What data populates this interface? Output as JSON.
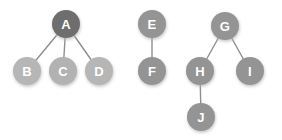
{
  "diagram": {
    "background_color": "#ffffff",
    "node_radius": 14,
    "label_font_size": 13,
    "edge_color": "#8e8e8e",
    "edge_width": 1.4,
    "shadow_color": "#c9c9c9",
    "components": [
      {
        "id": "component-1",
        "name": "star-component-a"
      },
      {
        "id": "component-2",
        "name": "pair-component-ef"
      },
      {
        "id": "component-3",
        "name": "tree-component-g"
      }
    ],
    "nodes": [
      {
        "id": "A",
        "label": "A",
        "cx": 66,
        "cy": 24,
        "color": "#6e6e6e",
        "component": "component-1"
      },
      {
        "id": "B",
        "label": "B",
        "cx": 27,
        "cy": 71,
        "color": "#b6b6b6",
        "component": "component-1"
      },
      {
        "id": "C",
        "label": "C",
        "cx": 63,
        "cy": 71,
        "color": "#b2b2b2",
        "component": "component-1"
      },
      {
        "id": "D",
        "label": "D",
        "cx": 99,
        "cy": 71,
        "color": "#b6b6b6",
        "component": "component-1"
      },
      {
        "id": "E",
        "label": "E",
        "cx": 152,
        "cy": 24,
        "color": "#949494",
        "component": "component-2"
      },
      {
        "id": "F",
        "label": "F",
        "cx": 152,
        "cy": 71,
        "color": "#949494",
        "component": "component-2"
      },
      {
        "id": "G",
        "label": "G",
        "cx": 225,
        "cy": 26,
        "color": "#949494",
        "component": "component-3"
      },
      {
        "id": "H",
        "label": "H",
        "cx": 200,
        "cy": 71,
        "color": "#949494",
        "component": "component-3"
      },
      {
        "id": "I",
        "label": "I",
        "cx": 250,
        "cy": 71,
        "color": "#949494",
        "component": "component-3"
      },
      {
        "id": "J",
        "label": "J",
        "cx": 201,
        "cy": 117,
        "color": "#949494",
        "component": "component-3"
      }
    ],
    "edges": [
      {
        "id": "edge-A-B",
        "source": "A",
        "target": "B",
        "x1": 66,
        "y1": 24,
        "x2": 27,
        "y2": 71
      },
      {
        "id": "edge-A-C",
        "source": "A",
        "target": "C",
        "x1": 66,
        "y1": 24,
        "x2": 63,
        "y2": 71
      },
      {
        "id": "edge-A-D",
        "source": "A",
        "target": "D",
        "x1": 66,
        "y1": 24,
        "x2": 99,
        "y2": 71
      },
      {
        "id": "edge-E-F",
        "source": "E",
        "target": "F",
        "x1": 152,
        "y1": 24,
        "x2": 152,
        "y2": 71
      },
      {
        "id": "edge-G-H",
        "source": "G",
        "target": "H",
        "x1": 225,
        "y1": 26,
        "x2": 200,
        "y2": 71
      },
      {
        "id": "edge-G-I",
        "source": "G",
        "target": "I",
        "x1": 225,
        "y1": 26,
        "x2": 250,
        "y2": 71
      },
      {
        "id": "edge-H-J",
        "source": "H",
        "target": "J",
        "x1": 200,
        "y1": 71,
        "x2": 201,
        "y2": 117
      }
    ]
  }
}
